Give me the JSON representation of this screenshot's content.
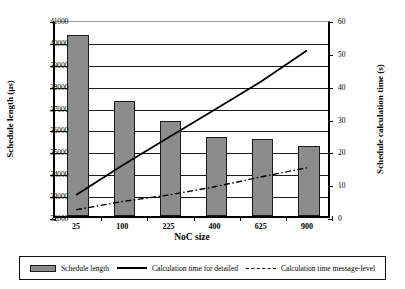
{
  "chart_data": {
    "type": "bar",
    "title": "",
    "xlabel": "NoC size",
    "ylabel": "Schedule length (µs)",
    "y2label": "Schedule calculation time (s)",
    "categories": [
      "25",
      "100",
      "225",
      "400",
      "625",
      "900"
    ],
    "ylim": [
      32000,
      41000
    ],
    "yticks": [
      "32000",
      "33000",
      "34000",
      "35000",
      "36000",
      "37000",
      "38000",
      "39000",
      "40000",
      "41000"
    ],
    "y2lim": [
      0,
      60
    ],
    "y2ticks": [
      "0",
      "10",
      "20",
      "30",
      "40",
      "50",
      "60"
    ],
    "grid": true,
    "legend_position": "bottom",
    "series": [
      {
        "name": "Schedule length",
        "type": "bar",
        "axis": "left",
        "values": [
          40250,
          37250,
          36350,
          35600,
          35520,
          35220
        ]
      },
      {
        "name": "Calculation time for detailed",
        "type": "line",
        "style": "solid",
        "axis": "right",
        "values": [
          7.0,
          16.0,
          24.5,
          33.0,
          41.5,
          51.0
        ]
      },
      {
        "name": "Calculation time message-level",
        "type": "line",
        "style": "dash-dot",
        "axis": "right",
        "values": [
          2.5,
          5.0,
          7.0,
          9.5,
          12.5,
          15.3
        ]
      }
    ]
  },
  "axes": {
    "left_title": "Schedule length (µs)",
    "right_title": "Schedule calculation time (s)",
    "bottom_title": "NoC size"
  },
  "legend": {
    "items": [
      {
        "label": "Schedule length",
        "marker": "bar-swatch-icon"
      },
      {
        "label": "Calculation time for detailed",
        "marker": "solid-line-icon"
      },
      {
        "label": "Calculation time message-level",
        "marker": "dash-dot-line-icon"
      }
    ]
  }
}
